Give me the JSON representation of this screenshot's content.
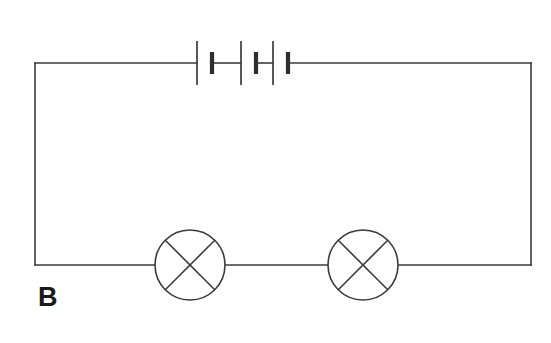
{
  "diagram": {
    "label": "B",
    "background_color": "#ffffff",
    "line_color": "#3b3b3b",
    "canvas": {
      "width": 551,
      "height": 343
    }
  },
  "circuit": {
    "loop": {
      "left_x": 35,
      "right_x": 531,
      "top_y": 63,
      "bottom_y": 265
    },
    "battery": {
      "name": "battery-three-cells",
      "cell_count": 3,
      "center_y": 63,
      "start_x": 197,
      "end_x": 288,
      "long_plate_height": 44,
      "short_plate_height": 22,
      "cells": [
        {
          "long_plate_x": 197,
          "short_plate_x": 212
        },
        {
          "long_plate_x": 241,
          "short_plate_x": 256
        },
        {
          "long_plate_x": 273,
          "short_plate_x": 288
        }
      ]
    },
    "lamps": [
      {
        "name": "lamp-left",
        "cx": 190,
        "cy": 265,
        "r": 35
      },
      {
        "name": "lamp-right",
        "cx": 363,
        "cy": 265,
        "r": 35
      }
    ],
    "wires": [
      {
        "name": "wire-top-left",
        "from_x": 35,
        "from_y": 63,
        "to_x": 197,
        "to_y": 63
      },
      {
        "name": "wire-battery-cell-1-2",
        "from_x": 212,
        "from_y": 63,
        "to_x": 241,
        "to_y": 63
      },
      {
        "name": "wire-battery-cell-2-3",
        "from_x": 256,
        "from_y": 63,
        "to_x": 273,
        "to_y": 63
      },
      {
        "name": "wire-top-right",
        "from_x": 288,
        "from_y": 63,
        "to_x": 531,
        "to_y": 63
      },
      {
        "name": "wire-right-side",
        "from_x": 531,
        "from_y": 63,
        "to_x": 531,
        "to_y": 265
      },
      {
        "name": "wire-left-side",
        "from_x": 35,
        "from_y": 63,
        "to_x": 35,
        "to_y": 265
      },
      {
        "name": "wire-bottom-left",
        "from_x": 35,
        "from_y": 265,
        "to_x": 155,
        "to_y": 265
      },
      {
        "name": "wire-between-lamps",
        "from_x": 225,
        "from_y": 265,
        "to_x": 328,
        "to_y": 265
      },
      {
        "name": "wire-bottom-right",
        "from_x": 398,
        "from_y": 265,
        "to_x": 531,
        "to_y": 265
      }
    ]
  }
}
